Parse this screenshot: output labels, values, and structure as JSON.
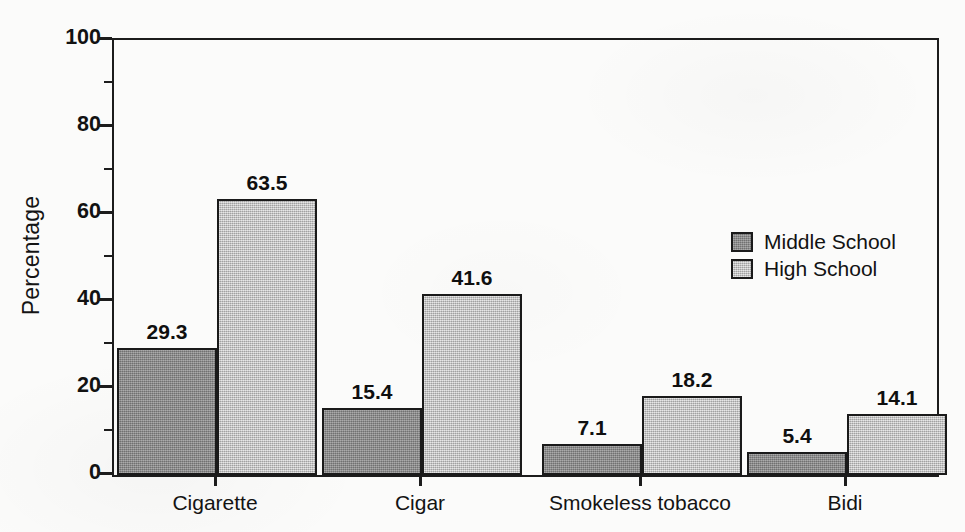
{
  "chart_data": {
    "type": "bar",
    "title": "",
    "subtitle": "",
    "xlabel": "",
    "ylabel": "Percentage",
    "categories": [
      "Cigarette",
      "Cigar",
      "Smokeless tobacco",
      "Bidi"
    ],
    "series": [
      {
        "name": "Middle School",
        "color": "#8a8a8a",
        "values": [
          29.3,
          15.4,
          7.1,
          5.4
        ],
        "value_labels": [
          "29.3",
          "15.4",
          "7.1",
          "5.4"
        ]
      },
      {
        "name": "High School",
        "color": "#c9c9c9",
        "values": [
          63.5,
          41.6,
          18.2,
          14.1
        ],
        "value_labels": [
          "63.5",
          "41.6",
          "18.2",
          "14.1"
        ]
      }
    ],
    "ylim": [
      0,
      100
    ],
    "y_major_ticks": [
      0,
      20,
      40,
      60,
      80,
      100
    ],
    "y_tick_labels": [
      "0",
      "20",
      "40",
      "60",
      "80",
      "100"
    ],
    "y_minor_ticks": [
      10,
      30,
      50,
      70,
      90
    ],
    "grid": false,
    "legend_position": "upper right",
    "frame": "full-box",
    "bar_outline_color": "#1a1a1a",
    "axis_color": "#1c1c1c"
  },
  "legend": {
    "entries": [
      {
        "label": "Middle School",
        "swatch": "dark-gray-swatch"
      },
      {
        "label": "High School",
        "swatch": "light-gray-swatch"
      }
    ]
  },
  "axes": {
    "y_title": "Percentage",
    "y_labels": [
      "100",
      "80",
      "60",
      "40",
      "20",
      "0"
    ],
    "x_labels": [
      "Cigarette",
      "Cigar",
      "Smokeless tobacco",
      "Bidi"
    ]
  }
}
